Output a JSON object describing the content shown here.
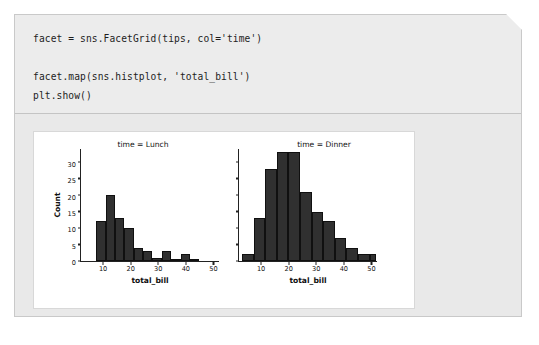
{
  "cell": {
    "code_text": "facet = sns.FacetGrid(tips, col='time')\n\nfacet.map(sns.histplot, 'total_bill')\nplt.show()",
    "code_lines": [
      "facet = sns.FacetGrid(tips, col='time')",
      "",
      "facet.map(sns.histplot, 'total_bill')",
      "plt.show()"
    ]
  },
  "colors": {
    "card_background": "#ebebeb",
    "card_border": "#c9c9c9",
    "code_background": "#ececec",
    "output_background": "#e9e9e9",
    "figure_background": "#ffffff",
    "bar_fill": "#303030",
    "bar_edge": "#101010",
    "axis": "#222222",
    "text": "#111111"
  },
  "chart_data": {
    "type": "bar",
    "title": "",
    "xlabel": "total_bill",
    "ylabel": "Count",
    "xlim": [
      2,
      52
    ],
    "ylim": [
      0,
      34
    ],
    "grid": false,
    "legend": null,
    "xticks": [
      10,
      20,
      30,
      40,
      50
    ],
    "yticks": [
      0,
      5,
      10,
      15,
      20,
      25,
      30
    ],
    "facet_variable": "time",
    "facets": [
      {
        "name": "Lunch",
        "title": "time = Lunch",
        "xlabel": "total_bill",
        "ylabel": "Count",
        "bin_edges": [
          7.5,
          10.9,
          14.3,
          17.7,
          21.1,
          24.5,
          27.9,
          31.3,
          34.7,
          38.1,
          41.5,
          44.9
        ],
        "bin_centers": [
          9.2,
          12.6,
          16.0,
          19.4,
          22.8,
          26.2,
          29.6,
          33.0,
          36.4,
          39.8,
          43.2
        ],
        "values": [
          12,
          20,
          13,
          10,
          4,
          3,
          1,
          3,
          0,
          2,
          0
        ]
      },
      {
        "name": "Dinner",
        "title": "time = Dinner",
        "xlabel": "total_bill",
        "ylabel": "Count",
        "bin_edges": [
          3.1,
          7.3,
          11.5,
          15.7,
          19.9,
          24.1,
          28.3,
          32.5,
          36.7,
          40.9,
          45.1,
          49.3,
          51.5
        ],
        "bin_centers": [
          5.2,
          9.4,
          13.6,
          17.8,
          22.0,
          26.2,
          30.4,
          34.6,
          38.8,
          43.0,
          47.2,
          50.4
        ],
        "values": [
          2,
          13,
          28,
          33,
          33,
          21,
          15,
          12,
          7,
          4,
          2,
          2,
          4
        ]
      }
    ]
  }
}
